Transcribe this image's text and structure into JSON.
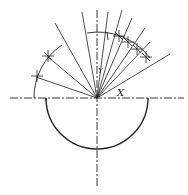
{
  "diagram": {
    "center": {
      "x": 97,
      "y": 98
    },
    "labels": {
      "x_axis": "X",
      "y_axis": "Y"
    },
    "semicircle_radius": 51,
    "arc_radius": 63,
    "rays": [
      {
        "to": [
          34,
          80
        ]
      },
      {
        "to": [
          45,
          45
        ]
      },
      {
        "to": [
          55,
          22
        ]
      },
      {
        "to": [
          82,
          12
        ]
      },
      {
        "to": [
          97,
          10
        ]
      },
      {
        "to": [
          108,
          12
        ]
      },
      {
        "to": [
          122,
          10
        ]
      },
      {
        "to": [
          132,
          18
        ]
      },
      {
        "to": [
          145,
          28
        ]
      },
      {
        "to": [
          150,
          44
        ]
      },
      {
        "to": [
          170,
          55
        ]
      }
    ],
    "markers": [
      {
        "x": 37,
        "y": 76
      },
      {
        "x": 48,
        "y": 57
      },
      {
        "x": 119,
        "y": 36
      },
      {
        "x": 128,
        "y": 41
      },
      {
        "x": 137,
        "y": 49
      },
      {
        "x": 146,
        "y": 57
      }
    ],
    "colors": {
      "line": "#222222",
      "background": "#ffffff"
    }
  }
}
